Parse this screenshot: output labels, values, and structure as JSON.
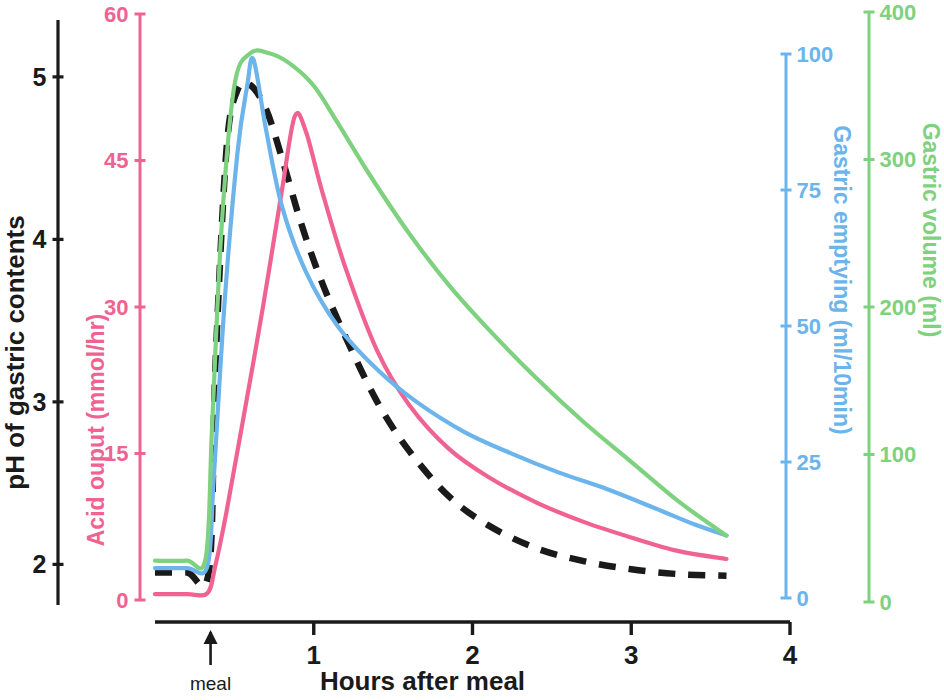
{
  "chart_data": {
    "type": "line",
    "title": "",
    "xlabel": "Hours after meal",
    "xlim": [
      0,
      4
    ],
    "x_ticks": [
      "1",
      "2",
      "3",
      "4"
    ],
    "x_tick_values": [
      1,
      2,
      3,
      4
    ],
    "grid": false,
    "legend_position": "none",
    "annotations": [
      {
        "name": "meal-marker",
        "label": "meal",
        "x": 0.35,
        "symbol": "up-arrow"
      }
    ],
    "axes": [
      {
        "id": "ph",
        "label": "pH of gastric contents",
        "color": "#1a1a1a",
        "ticks": [
          "2",
          "3",
          "4",
          "5"
        ],
        "tick_values": [
          2,
          3,
          4,
          5
        ],
        "range": [
          1.75,
          5.35
        ]
      },
      {
        "id": "acid",
        "label": "Acid ouput (mmol/hr)",
        "color": "#f06292",
        "ticks": [
          "0",
          "15",
          "30",
          "45",
          "60"
        ],
        "tick_values": [
          0,
          15,
          30,
          45,
          60
        ],
        "range": [
          0,
          60
        ]
      },
      {
        "id": "emptying",
        "label": "Gastric emptying (ml/10min)",
        "color": "#6cb4ec",
        "ticks": [
          "0",
          "25",
          "50",
          "75",
          "100"
        ],
        "tick_values": [
          0,
          25,
          50,
          75,
          100
        ],
        "range": [
          0,
          100
        ]
      },
      {
        "id": "volume",
        "label": "Gastric volume (ml)",
        "color": "#7ed17e",
        "ticks": [
          "0",
          "100",
          "200",
          "300",
          "400"
        ],
        "tick_values": [
          0,
          100,
          200,
          300,
          400
        ],
        "range": [
          0,
          400
        ]
      }
    ],
    "series": [
      {
        "name": "pH of gastric contents",
        "axis": "ph",
        "color": "#1a1a1a",
        "style": "dashed",
        "x": [
          0.0,
          0.2,
          0.34,
          0.38,
          0.45,
          0.52,
          0.6,
          0.7,
          0.8,
          0.92,
          1.05,
          1.2,
          1.4,
          1.6,
          1.85,
          2.1,
          2.4,
          2.7,
          3.0,
          3.3,
          3.6
        ],
        "values": [
          1.95,
          1.95,
          1.96,
          3.2,
          4.55,
          4.92,
          4.95,
          4.8,
          4.5,
          4.1,
          3.74,
          3.4,
          3.0,
          2.7,
          2.42,
          2.24,
          2.1,
          2.02,
          1.97,
          1.94,
          1.93
        ]
      },
      {
        "name": "Acid ouput (mmol/hr)",
        "axis": "acid",
        "color": "#f06292",
        "style": "solid",
        "x": [
          0.0,
          0.2,
          0.33,
          0.38,
          0.45,
          0.55,
          0.68,
          0.8,
          0.88,
          0.95,
          1.05,
          1.2,
          1.4,
          1.6,
          1.85,
          2.1,
          2.4,
          2.7,
          3.0,
          3.3,
          3.6
        ],
        "values": [
          0.6,
          0.6,
          0.7,
          3.5,
          9.0,
          18.0,
          30.0,
          42.0,
          49.5,
          48.0,
          42.0,
          34.0,
          25.5,
          20.0,
          15.5,
          12.6,
          10.0,
          8.0,
          6.4,
          5.0,
          4.2
        ]
      },
      {
        "name": "Gastric emptying (ml/10min)",
        "axis": "emptying",
        "color": "#6cb4ec",
        "style": "solid",
        "x": [
          0.0,
          0.2,
          0.33,
          0.37,
          0.44,
          0.52,
          0.58,
          0.62,
          0.7,
          0.8,
          0.95,
          1.15,
          1.4,
          1.65,
          1.95,
          2.25,
          2.55,
          2.85,
          3.15,
          3.4,
          3.6
        ],
        "values": [
          5.5,
          5.5,
          5.8,
          22.0,
          55.0,
          82.0,
          94.0,
          99.0,
          86.0,
          72.0,
          60.0,
          50.0,
          42.0,
          36.0,
          30.5,
          26.5,
          23.0,
          20.0,
          16.5,
          13.5,
          11.5
        ]
      },
      {
        "name": "Gastric volume (ml)",
        "axis": "volume",
        "color": "#7ed17e",
        "style": "solid",
        "x": [
          0.0,
          0.2,
          0.32,
          0.36,
          0.42,
          0.5,
          0.6,
          0.72,
          0.85,
          1.0,
          1.15,
          1.35,
          1.6,
          1.85,
          2.1,
          2.4,
          2.7,
          3.0,
          3.3,
          3.6
        ],
        "values": [
          28,
          28,
          30,
          120,
          255,
          350,
          372,
          372,
          365,
          350,
          325,
          290,
          250,
          215,
          185,
          152,
          122,
          95,
          68,
          45
        ]
      }
    ]
  }
}
